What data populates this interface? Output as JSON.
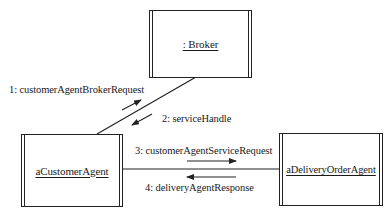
{
  "diagram": {
    "type": "UML communication diagram",
    "objects": [
      {
        "id": "broker",
        "label": ": Broker",
        "active": true
      },
      {
        "id": "customer_agent",
        "label": "aCustomerAgent",
        "active": true
      },
      {
        "id": "delivery_order_agent",
        "label": "aDeliveryOrderAgent",
        "active": true
      }
    ],
    "links": [
      {
        "from": "customer_agent",
        "to": "broker"
      },
      {
        "from": "customer_agent",
        "to": "delivery_order_agent"
      }
    ],
    "messages": [
      {
        "seq": 1,
        "label": "1: customerAgentBrokerRequest",
        "from": "customer_agent",
        "to": "broker",
        "direction": "up-right"
      },
      {
        "seq": 2,
        "label": "2: serviceHandle",
        "from": "broker",
        "to": "customer_agent",
        "direction": "down-left"
      },
      {
        "seq": 3,
        "label": "3: customerAgentServiceRequest",
        "from": "customer_agent",
        "to": "delivery_order_agent",
        "direction": "right"
      },
      {
        "seq": 4,
        "label": "4: deliveryAgentResponse",
        "from": "delivery_order_agent",
        "to": "customer_agent",
        "direction": "left"
      }
    ]
  }
}
